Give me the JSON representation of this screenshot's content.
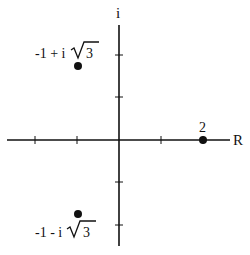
{
  "diagram": {
    "type": "complex-plane",
    "axes": {
      "real_label": "R",
      "imag_label": "i",
      "tick_spacing_units": 1,
      "x_ticks": [
        -2,
        -1,
        1,
        2
      ],
      "y_ticks": [
        2,
        1,
        -1,
        -2
      ]
    },
    "points": [
      {
        "label_prefix": "-1 + i",
        "label_radicand": "3",
        "re": -1,
        "im": 1.732
      },
      {
        "label_prefix": "",
        "label_radicand": "",
        "label": "2",
        "re": 2,
        "im": 0
      },
      {
        "label_prefix": "-1 - i",
        "label_radicand": "3",
        "re": -1,
        "im": -1.732
      }
    ],
    "colors": {
      "ink": "#111111",
      "background": "#ffffff"
    }
  }
}
